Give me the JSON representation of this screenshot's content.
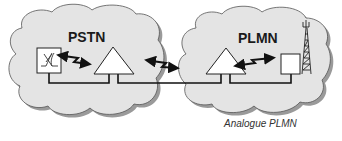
{
  "diagram": {
    "networks": [
      {
        "id": "pstn",
        "label": "PSTN"
      },
      {
        "id": "plmn",
        "label": "PLMN"
      }
    ],
    "caption": "Analogue PLMN",
    "icons": {
      "switch": "crossbar-switch-icon",
      "exchange": "triangle-exchange-icon",
      "base_station": "base-station-icon",
      "antenna": "antenna-tower-icon",
      "signal": "lightning-bidirectional-arrow-icon"
    },
    "colors": {
      "cloud_fill": "#e4e4e4",
      "cloud_shadow": "#9a9a9a",
      "line": "#111111",
      "caption": "#333333"
    }
  }
}
